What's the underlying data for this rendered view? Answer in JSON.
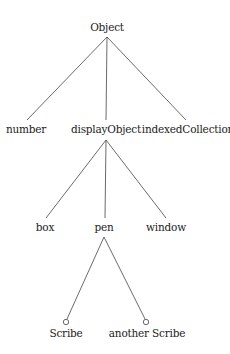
{
  "diagram": {
    "type": "class-hierarchy-tree",
    "line_color": "#444444",
    "nodes": {
      "root": {
        "label": "Object"
      },
      "number": {
        "label": "number"
      },
      "displayObject": {
        "label": "displayObject"
      },
      "indexedCollection": {
        "label": "indexedCollection"
      },
      "box": {
        "label": "box"
      },
      "pen": {
        "label": "pen"
      },
      "window": {
        "label": "window"
      },
      "scribe": {
        "label": "Scribe",
        "instance": true
      },
      "anotherScribe": {
        "label": "another Scribe",
        "instance": true
      }
    },
    "edges": [
      [
        "Object",
        "number"
      ],
      [
        "Object",
        "displayObject"
      ],
      [
        "Object",
        "indexedCollection"
      ],
      [
        "displayObject",
        "box"
      ],
      [
        "displayObject",
        "pen"
      ],
      [
        "displayObject",
        "window"
      ],
      [
        "pen",
        "Scribe"
      ],
      [
        "pen",
        "another Scribe"
      ]
    ]
  }
}
